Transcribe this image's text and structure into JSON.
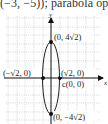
{
  "top_text": "(−3, −5)); parabola ope",
  "figure": {
    "axis_labels": {
      "x": "x",
      "y": "y"
    },
    "points": {
      "top_vertex": "(0, 4√2)",
      "bottom_vertex": "(0, −4√2)",
      "left_covertex": "(−√2, 0)",
      "right_covertex": "(√2, 0)",
      "center": "c(0, 0)"
    },
    "colors": {
      "grid": "#b8b8b8",
      "axis": "#111111",
      "curve": "#222222"
    }
  }
}
